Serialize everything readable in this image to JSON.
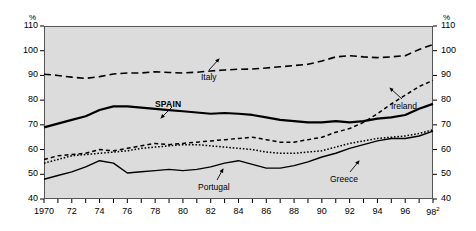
{
  "chart_data": {
    "type": "line",
    "title": "",
    "xlabel": "",
    "ylabel": "%",
    "unit_left": "%",
    "unit_right": "%",
    "ylim": [
      40,
      110
    ],
    "ytick_values": [
      40,
      50,
      60,
      70,
      80,
      90,
      100,
      110
    ],
    "ytick_labels": [
      "40",
      "50",
      "60",
      "70",
      "80",
      "90",
      "100",
      "110"
    ],
    "ytick_labels_right": [
      "40",
      "50",
      "60",
      "70",
      "80",
      "90",
      "100",
      "110"
    ],
    "xlim": [
      1970,
      1998
    ],
    "x": [
      1970,
      1971,
      1972,
      1973,
      1974,
      1975,
      1976,
      1977,
      1978,
      1979,
      1980,
      1981,
      1982,
      1983,
      1984,
      1985,
      1986,
      1987,
      1988,
      1989,
      1990,
      1991,
      1992,
      1993,
      1994,
      1995,
      1996,
      1997,
      1998
    ],
    "xtick_values": [
      1970,
      1971,
      1972,
      1973,
      1974,
      1975,
      1976,
      1977,
      1978,
      1979,
      1980,
      1981,
      1982,
      1983,
      1984,
      1985,
      1986,
      1987,
      1988,
      1989,
      1990,
      1991,
      1992,
      1993,
      1994,
      1995,
      1996,
      1997,
      1998
    ],
    "xtick_labels": [
      "1970",
      "",
      "72",
      "",
      "74",
      "",
      "76",
      "",
      "78",
      "",
      "80",
      "",
      "82",
      "",
      "84",
      "",
      "86",
      "",
      "88",
      "",
      "90",
      "",
      "92",
      "",
      "94",
      "",
      "96",
      "",
      "98"
    ],
    "xtick_last_superscript": "2",
    "grid": false,
    "legend": "inline-annotations",
    "series": [
      {
        "name": "Italy",
        "style": "dashed",
        "width": 1.6,
        "color": "#000000",
        "values": [
          90.5,
          90.0,
          89.3,
          88.8,
          89.5,
          90.6,
          91.0,
          91.0,
          91.5,
          91.2,
          91.0,
          91.3,
          91.8,
          92.2,
          92.5,
          92.6,
          93.0,
          93.5,
          94.0,
          94.5,
          95.8,
          97.5,
          98.0,
          97.5,
          97.2,
          97.5,
          98.0,
          100.5,
          102.5
        ]
      },
      {
        "name": "SPAIN",
        "style": "solid",
        "width": 2.2,
        "color": "#000000",
        "values": [
          69.0,
          70.5,
          72.0,
          73.5,
          76.0,
          77.5,
          77.5,
          77.0,
          76.5,
          76.0,
          75.5,
          75.0,
          74.5,
          74.8,
          74.5,
          74.0,
          73.0,
          72.0,
          71.5,
          71.0,
          71.0,
          71.5,
          71.0,
          71.5,
          72.5,
          73.0,
          74.0,
          76.5,
          78.5
        ]
      },
      {
        "name": "Ireland",
        "style": "dashed-fine",
        "width": 1.5,
        "color": "#000000",
        "values": [
          56.0,
          57.5,
          58.0,
          58.5,
          60.0,
          59.5,
          60.5,
          61.5,
          62.5,
          62.0,
          62.5,
          63.0,
          63.5,
          64.0,
          64.5,
          65.0,
          64.0,
          63.0,
          63.0,
          64.0,
          65.0,
          67.0,
          68.5,
          71.0,
          74.5,
          78.5,
          82.0,
          85.5,
          88.0
        ]
      },
      {
        "name": "Greece",
        "style": "dotted",
        "width": 1.5,
        "color": "#000000",
        "values": [
          54.5,
          56.0,
          57.5,
          58.0,
          58.5,
          59.0,
          59.5,
          60.5,
          61.0,
          61.5,
          62.0,
          62.0,
          61.5,
          61.0,
          60.5,
          60.0,
          59.0,
          58.5,
          58.5,
          59.0,
          59.5,
          61.0,
          62.5,
          63.5,
          64.5,
          65.0,
          65.5,
          66.5,
          68.0
        ]
      },
      {
        "name": "Portugal",
        "style": "solid-thin",
        "width": 1.4,
        "color": "#000000",
        "values": [
          48.0,
          49.5,
          51.0,
          53.0,
          55.5,
          54.5,
          50.5,
          51.0,
          51.5,
          52.0,
          51.5,
          52.0,
          53.0,
          54.5,
          55.5,
          54.0,
          52.5,
          52.5,
          53.5,
          55.0,
          57.0,
          58.5,
          60.5,
          62.0,
          63.5,
          64.5,
          64.5,
          65.5,
          67.5
        ]
      }
    ],
    "annotations": [
      {
        "label": "Italy",
        "bold": false,
        "label_x": 201,
        "label_y": 72,
        "arrow_from_x": 209,
        "arrow_from_y": 70,
        "arrow_to_x": 219,
        "arrow_to_y": 59
      },
      {
        "label": "SPAIN",
        "bold": true,
        "label_x": 155,
        "label_y": 99,
        "arrow_from_x": 172,
        "arrow_from_y": 107,
        "arrow_to_x": 161,
        "arrow_to_y": 118
      },
      {
        "label": "Ireland",
        "bold": false,
        "label_x": 391,
        "label_y": 101,
        "arrow_from_x": 402,
        "arrow_from_y": 99,
        "arrow_to_x": 390,
        "arrow_to_y": 88
      },
      {
        "label": "Portugal",
        "bold": false,
        "label_x": 198,
        "label_y": 182,
        "arrow_from_x": 217,
        "arrow_from_y": 180,
        "arrow_to_x": 223,
        "arrow_to_y": 169
      },
      {
        "label": "Greece",
        "bold": false,
        "label_x": 330,
        "label_y": 174,
        "arrow_from_x": 350,
        "arrow_from_y": 172,
        "arrow_to_x": 359,
        "arrow_to_y": 161
      }
    ]
  }
}
